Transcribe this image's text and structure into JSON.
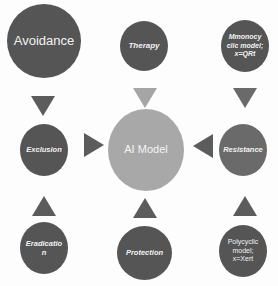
{
  "diagram": {
    "type": "hub-and-spoke",
    "center": {
      "label": "AI Model",
      "color": "#a8a8a8"
    },
    "nodes": {
      "top_left": {
        "label": "Avoidance"
      },
      "top_center": {
        "label": "Therapy"
      },
      "top_right": {
        "label_lines": [
          "Mmonocy",
          "clic model;",
          "x=QRt"
        ]
      },
      "middle_left": {
        "label": "Exclusion"
      },
      "middle_right": {
        "label": "Resistance"
      },
      "bottom_left": {
        "label_lines": [
          "Eradicatio",
          "n"
        ]
      },
      "bottom_center": {
        "label": "Protection"
      },
      "bottom_right": {
        "label_lines": [
          "Polycyclic",
          "model;",
          "x=Xert"
        ]
      }
    },
    "arrows": [
      {
        "from": "Avoidance",
        "to": "Exclusion",
        "direction": "down"
      },
      {
        "from": "Therapy",
        "to": "AI Model",
        "direction": "down"
      },
      {
        "from": "Mmonocyclic model",
        "to": "Resistance",
        "direction": "down"
      },
      {
        "from": "Exclusion",
        "to": "AI Model",
        "direction": "right"
      },
      {
        "from": "Resistance",
        "to": "AI Model",
        "direction": "left"
      },
      {
        "from": "Eradication",
        "to": "Exclusion",
        "direction": "up"
      },
      {
        "from": "Protection",
        "to": "AI Model",
        "direction": "up"
      },
      {
        "from": "Polycyclic model",
        "to": "Resistance",
        "direction": "up"
      }
    ],
    "colors": {
      "node_dark": "#555555",
      "node_mid": "#6a6a6a",
      "center": "#a8a8a8",
      "arrow_dark": "#5c5c5c",
      "arrow_light": "#a5a5a5",
      "text": "#f2f2f2"
    }
  }
}
